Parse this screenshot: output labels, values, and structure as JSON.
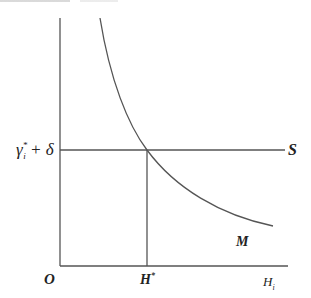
{
  "diagram": {
    "type": "economics-equilibrium-graph",
    "origin_label": "O",
    "x_axis_label": "H",
    "x_axis_label_subscript": "i",
    "y_level_label": "γ",
    "y_level_label_sub": "i",
    "y_level_label_sup": "*",
    "y_level_label_rest": " + δ",
    "equilibrium_x_label": "H",
    "equilibrium_x_label_sup": "*",
    "horizontal_line_label": "S",
    "curve_label": "M",
    "colors": {
      "lines": "#555555",
      "text": "#222222",
      "background": "#ffffff"
    }
  }
}
